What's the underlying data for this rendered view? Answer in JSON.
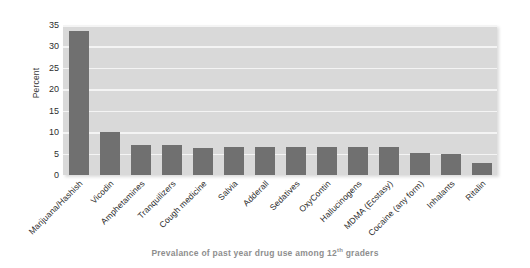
{
  "chart_data": {
    "type": "bar",
    "title": "",
    "subtitle": "",
    "caption": "Prevalance of past year drug use among 12th graders",
    "caption_prefix": "Prevalance of past year drug use among 12",
    "caption_superscript": "th",
    "caption_suffix": " graders",
    "xlabel": "",
    "ylabel": "Percent",
    "ylim": [
      0,
      35
    ],
    "ytick_step": 5,
    "yticks": [
      0,
      5,
      10,
      15,
      20,
      25,
      30,
      35
    ],
    "ytick_labels": [
      "0",
      "5",
      "10",
      "15",
      "20",
      "25",
      "30",
      "35"
    ],
    "grid": "horizontal",
    "legend": "none",
    "bar_color": "#707070",
    "plot_background": "#d9d9d9",
    "gridline_color": "#f4f4f4",
    "categories": [
      "Marijuana/Hashish",
      "Vicodin",
      "Amphetamines",
      "Tranquilizers",
      "Cough medicine",
      "Salvia",
      "Adderall",
      "Sedatives",
      "OxyContin",
      "Hallucinogens",
      "MDMA (Ecstasy)",
      "Cocaine (any form)",
      "Inhalants",
      "Ritalin"
    ],
    "values": [
      33.5,
      10.0,
      7.0,
      6.9,
      6.4,
      6.5,
      6.6,
      6.6,
      6.6,
      6.5,
      6.5,
      5.2,
      5.0,
      2.7
    ]
  }
}
